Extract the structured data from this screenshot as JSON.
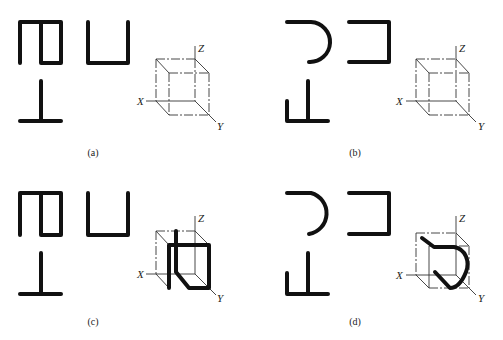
{
  "figure": {
    "panels": [
      {
        "id": "a",
        "caption": "(a)",
        "axes": {
          "x": "X",
          "y": "Y",
          "z": "Z"
        }
      },
      {
        "id": "b",
        "caption": "(b)",
        "axes": {
          "x": "X",
          "y": "Y",
          "z": "Z"
        }
      },
      {
        "id": "c",
        "caption": "(c)",
        "axes": {
          "x": "X",
          "y": "Y",
          "z": "Z"
        }
      },
      {
        "id": "d",
        "caption": "(d)",
        "axes": {
          "x": "X",
          "y": "Y",
          "z": "Z"
        }
      }
    ]
  }
}
